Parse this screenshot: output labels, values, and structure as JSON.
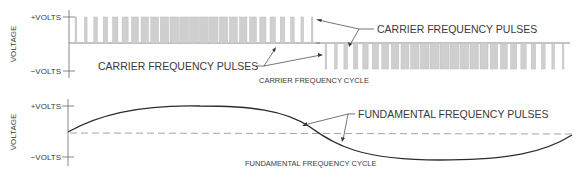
{
  "top_panel": {
    "y_axis_label": "VOLTAGE",
    "plus_label": "+VOLTS",
    "minus_label": "−VOLTS",
    "cycle_label": "CARRIER FREQUENCY CYCLE",
    "callout_upper": "CARRIER FREQUENCY PULSES",
    "callout_lower": "CARRIER FREQUENCY PULSES",
    "pulse_fill_color": "#cfcfcf"
  },
  "bottom_panel": {
    "y_axis_label": "VOLTAGE",
    "plus_label": "+VOLTS",
    "minus_label": "−VOLTS",
    "cycle_label": "FUNDAMENTAL FREQUENCY CYCLE",
    "callout": "FUNDAMENTAL FREQUENCY PULSES",
    "sine_color": "#2c2c2c"
  }
}
